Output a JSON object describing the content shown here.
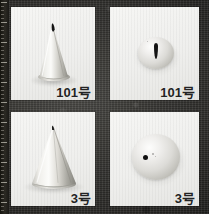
{
  "figure": {
    "background_color": "#2e2d2a",
    "panel_color": "#f1f1ef",
    "label_color": "#232323",
    "layout": "2x2",
    "ruler_edge": "left"
  },
  "panels": [
    {
      "id": "tl",
      "label": "101号",
      "tip_number": "101",
      "unit_suffix": "号",
      "view": "side",
      "object": "petal-piping-tip-side",
      "description": "Narrow metallic cone, flattened teardrop slot at apex"
    },
    {
      "id": "tr",
      "label": "101号",
      "tip_number": "101",
      "unit_suffix": "号",
      "view": "top",
      "object": "petal-piping-tip-top",
      "description": "Round barrel seen end-on with vertical teardrop slit aperture"
    },
    {
      "id": "bl",
      "label": "3号",
      "tip_number": "3",
      "unit_suffix": "号",
      "view": "side",
      "object": "round-piping-tip-side",
      "description": "Wide metallic cone tapering to small round opening"
    },
    {
      "id": "br",
      "label": "3号",
      "tip_number": "3",
      "unit_suffix": "号",
      "view": "top",
      "object": "round-piping-tip-top",
      "description": "Round barrel seen end-on with small circular aperture"
    }
  ]
}
